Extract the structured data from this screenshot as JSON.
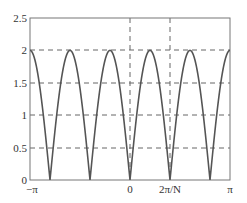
{
  "chart_data": {
    "type": "line",
    "title": "",
    "xlabel": "",
    "ylabel": "",
    "xlim": [
      -3.14159,
      3.14159
    ],
    "ylim": [
      0,
      2.5
    ],
    "grid": "dashed at y=0.5,1,1.5,2 and x=0, 2π/N",
    "x_ticks": [
      "−π",
      "0",
      "2π/N",
      "π"
    ],
    "y_ticks": [
      "0",
      "0.5",
      "1",
      "1.5",
      "2",
      "2.5"
    ],
    "series": [
      {
        "name": "2|sin(Nω/2)|, N=5",
        "N": 5,
        "amplitude": 2,
        "peaks_x": [
          "−π",
          "−3π/5",
          "−π/5",
          "π/5",
          "3π/5",
          "π"
        ],
        "zeros_x": [
          "−4π/5",
          "−2π/5",
          "0",
          "2π/5",
          "4π/5"
        ],
        "peak_value": 2,
        "color": "#555555"
      }
    ],
    "legend": null
  },
  "axes": {
    "y_labels": [
      "0",
      "0.5",
      "1",
      "1.5",
      "2",
      "2.5"
    ],
    "x_labels": {
      "neg_pi": "−π",
      "zero": "0",
      "two_pi_over_n": "2π/N",
      "pi": "π"
    }
  },
  "colors": {
    "curve": "#555555",
    "axes": "#777777",
    "grid": "#666666"
  }
}
